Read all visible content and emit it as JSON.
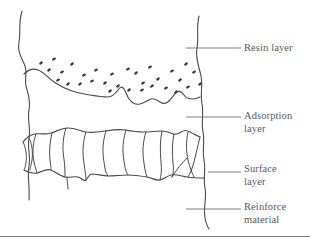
{
  "figure": {
    "type": "technical-cross-section-diagram",
    "background_color": "#ffffff",
    "line_color": "#4a4a4a",
    "text_color": "#5a5a5a",
    "rule_color": "#7a7a7a"
  },
  "labels": [
    {
      "id": "resin",
      "text": "Resin layer",
      "leader_y": 48,
      "leader_x1": 186,
      "leader_x2": 241
    },
    {
      "id": "adsorption",
      "text": "Adsorption\nlayer",
      "leader_y": 117,
      "leader_x1": 186,
      "leader_x2": 241
    },
    {
      "id": "surface",
      "text": "Surface\nlayer",
      "leader_y": 172,
      "leader_x1": 208,
      "leader_x2": 241
    },
    {
      "id": "reinforce",
      "text": "Reinforce\nmaterial",
      "leader_y": 209,
      "leader_x1": 186,
      "leader_x2": 241
    }
  ],
  "particles": {
    "name": "resin-particles",
    "count": 31,
    "color": "#3a3a3a",
    "points": [
      [
        41,
        63
      ],
      [
        54,
        59
      ],
      [
        49,
        70
      ],
      [
        62,
        72
      ],
      [
        72,
        64
      ],
      [
        84,
        75
      ],
      [
        80,
        84
      ],
      [
        92,
        81
      ],
      [
        68,
        84
      ],
      [
        96,
        70
      ],
      [
        105,
        83
      ],
      [
        112,
        74
      ],
      [
        118,
        86
      ],
      [
        128,
        69
      ],
      [
        136,
        73
      ],
      [
        143,
        83
      ],
      [
        129,
        90
      ],
      [
        150,
        67
      ],
      [
        158,
        79
      ],
      [
        166,
        88
      ],
      [
        152,
        86
      ],
      [
        172,
        71
      ],
      [
        180,
        80
      ],
      [
        188,
        87
      ],
      [
        176,
        92
      ],
      [
        194,
        72
      ],
      [
        200,
        84
      ],
      [
        58,
        80
      ],
      [
        110,
        91
      ],
      [
        142,
        90
      ],
      [
        186,
        64
      ]
    ]
  },
  "bottom_rule": {
    "name": "figure-bottom-rule",
    "y": 236
  }
}
